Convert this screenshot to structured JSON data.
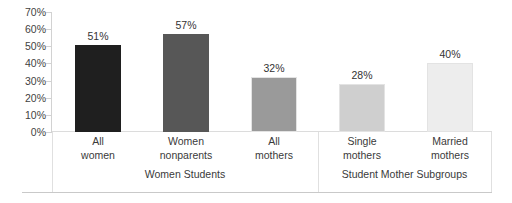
{
  "chart_data": {
    "type": "bar",
    "title": "",
    "subtitle": "",
    "xlabel": "",
    "ylabel": "",
    "ylim": [
      0,
      70
    ],
    "grid": false,
    "legend": "none",
    "orientation": "vertical",
    "categories": [
      "All women",
      "Women nonparents",
      "All mothers",
      "Single mothers",
      "Married mothers"
    ],
    "values": [
      51,
      57,
      32,
      28,
      40
    ],
    "value_labels": [
      "51%",
      "57%",
      "32%",
      "28%",
      "40%"
    ],
    "bar_colors": [
      "#1f1f1f",
      "#575757",
      "#9a9a9a",
      "#cfcfcf",
      "#ededed"
    ],
    "y_ticks": [
      70,
      60,
      50,
      40,
      30,
      20,
      10,
      0
    ],
    "y_tick_labels": [
      "70%",
      "60%",
      "50%",
      "40%",
      "30%",
      "20%",
      "10%",
      "0%"
    ],
    "bars": [
      {
        "label_line1": "All",
        "label_line2": "women",
        "value": 51,
        "value_label": "51%",
        "color": "#1f1f1f",
        "group": "Women Students"
      },
      {
        "label_line1": "Women",
        "label_line2": "nonparents",
        "value": 57,
        "value_label": "57%",
        "color": "#575757",
        "group": "Women Students"
      },
      {
        "label_line1": "All",
        "label_line2": "mothers",
        "value": 32,
        "value_label": "32%",
        "color": "#9a9a9a",
        "group": "Women Students"
      },
      {
        "label_line1": "Single",
        "label_line2": "mothers",
        "value": 28,
        "value_label": "28%",
        "color": "#cfcfcf",
        "group": "Student Mother Subgroups"
      },
      {
        "label_line1": "Married",
        "label_line2": "mothers",
        "value": 40,
        "value_label": "40%",
        "color": "#ededed",
        "group": "Student Mother Subgroups"
      }
    ],
    "groups": [
      {
        "label": "Women Students",
        "bar_indices": [
          0,
          1,
          2
        ]
      },
      {
        "label": "Student Mother Subgroups",
        "bar_indices": [
          3,
          4
        ]
      }
    ]
  }
}
